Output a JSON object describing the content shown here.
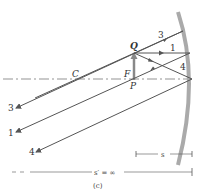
{
  "diagram": {
    "caption": "(c)",
    "labels": {
      "center": "C",
      "focal": "F",
      "object_base": "P",
      "object_tip": "Q"
    },
    "rays": [
      {
        "id": "1",
        "label": "1"
      },
      {
        "id": "3",
        "label": "3"
      },
      {
        "id": "4",
        "label": "4"
      }
    ],
    "rays_out": [
      {
        "id": "3",
        "label": "3"
      },
      {
        "id": "1",
        "label": "1"
      },
      {
        "id": "4",
        "label": "4"
      }
    ],
    "dimensions": {
      "object_distance": "s",
      "image_distance": "s′ = ∞"
    },
    "colors": {
      "ray": "#555555",
      "mirror": "#a0a0a0",
      "axis": "#666666",
      "text": "#333333"
    }
  }
}
